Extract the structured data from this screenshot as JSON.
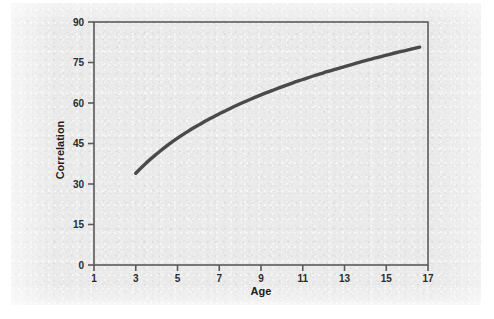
{
  "figure": {
    "background_color": "#ebebeb",
    "page_color": "#ffffff",
    "frame_color": "#5a5a5a",
    "ink_color": "#4a4a4a"
  },
  "chart_data": {
    "type": "line",
    "title": "",
    "xlabel": "Age",
    "ylabel": "Correlation",
    "xlim": [
      1,
      17
    ],
    "ylim": [
      0,
      90
    ],
    "xticks": [
      "1",
      "3",
      "5",
      "7",
      "9",
      "11",
      "13",
      "15",
      "17"
    ],
    "yticks": [
      "0",
      "15",
      "30",
      "45",
      "60",
      "75",
      "90"
    ],
    "grid": false,
    "legend": null,
    "series": [
      {
        "name": "Correlation vs Age",
        "color": "#4a4a4a",
        "linewidth": 3.4,
        "x": [
          3.0,
          3.5,
          4.0,
          4.5,
          5.0,
          5.5,
          6.0,
          6.5,
          7.0,
          7.5,
          8.0,
          8.5,
          9.0,
          9.5,
          10.0,
          10.5,
          11.0,
          11.5,
          12.0,
          12.5,
          13.0,
          13.5,
          14.0,
          14.5,
          15.0,
          15.5,
          16.0,
          16.6
        ],
        "y": [
          34.0,
          37.8,
          41.1,
          44.2,
          47.0,
          49.5,
          51.8,
          54.0,
          56.0,
          57.9,
          59.7,
          61.4,
          63.0,
          64.5,
          66.0,
          67.4,
          68.7,
          70.0,
          71.2,
          72.4,
          73.5,
          74.6,
          75.7,
          76.7,
          77.7,
          78.7,
          79.6,
          80.7
        ]
      }
    ],
    "annotations": []
  }
}
